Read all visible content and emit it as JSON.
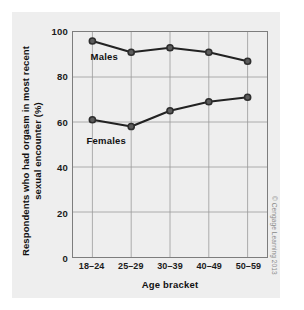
{
  "chart_data": {
    "type": "line",
    "title": "",
    "subtitle": "",
    "xlabel": "Age bracket",
    "ylabel": "Respondents who had orgasm in most recent sexual encounter (%)",
    "ylabel_line1": "Respondents who had orgasm in most recent",
    "ylabel_line2": "sexual encounter (%)",
    "categories": [
      "18–24",
      "25–29",
      "30–39",
      "40–49",
      "50–59"
    ],
    "series": [
      {
        "name": "Males",
        "values": [
          96,
          91,
          93,
          91,
          87
        ]
      },
      {
        "name": "Females",
        "values": [
          61,
          58,
          65,
          69,
          71
        ]
      }
    ],
    "ylim": [
      0,
      100
    ],
    "yticks": [
      0,
      20,
      40,
      60,
      80,
      100
    ],
    "ytick_labels": [
      "0",
      "20",
      "40",
      "60",
      "80",
      "100"
    ],
    "grid": true,
    "grid_color": "#9a9a9a",
    "legend": "inline-labels",
    "legend_position": "inline",
    "line_color": "#222222",
    "marker_color": "#2e2e2e",
    "marker_shape": "circle",
    "annotations": [
      {
        "text": "Males",
        "series": "Males"
      },
      {
        "text": "Females",
        "series": "Females"
      }
    ]
  },
  "credit": {
    "text": "© Cengage Learning 2013"
  },
  "colors": {
    "figure_background": "#ffffff",
    "panel_background": "#eeeeee",
    "axis": "#7d7d7d",
    "text": "#111111"
  }
}
